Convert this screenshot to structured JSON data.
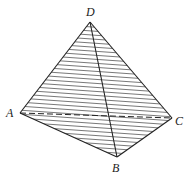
{
  "diagram": {
    "type": "tetrahedron",
    "vertices": [
      {
        "name": "D",
        "x": 90,
        "y": 22,
        "label_x": 86,
        "label_y": 16
      },
      {
        "name": "A",
        "x": 20,
        "y": 113,
        "label_x": 6,
        "label_y": 117
      },
      {
        "name": "C",
        "x": 172,
        "y": 118,
        "label_x": 175,
        "label_y": 125
      },
      {
        "name": "B",
        "x": 117,
        "y": 157,
        "label_x": 112,
        "label_y": 172
      }
    ],
    "edges": [
      {
        "from": "D",
        "to": "A",
        "style": "solid"
      },
      {
        "from": "D",
        "to": "C",
        "style": "solid"
      },
      {
        "from": "D",
        "to": "B",
        "style": "solid"
      },
      {
        "from": "A",
        "to": "B",
        "style": "solid"
      },
      {
        "from": "B",
        "to": "C",
        "style": "solid"
      },
      {
        "from": "A",
        "to": "C",
        "style": "dashed"
      }
    ],
    "shaded_faces": [
      "DAB",
      "DBC"
    ],
    "colors": {
      "line": "#222222",
      "hatch": "#555555"
    }
  }
}
